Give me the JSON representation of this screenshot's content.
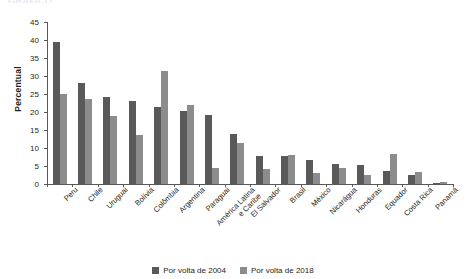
{
  "title_remnant": "GRÁFICO",
  "legend": {
    "position": "bottom",
    "items": [
      {
        "label": "Por volta de 2004",
        "color": "#595959"
      },
      {
        "label": "Por volta de 2018",
        "color": "#8c8c8c"
      }
    ]
  },
  "chart_data": {
    "type": "bar",
    "title": "",
    "xlabel": "",
    "ylabel": "Percentual",
    "ylim": [
      0,
      45
    ],
    "yticks": [
      0,
      5,
      10,
      15,
      20,
      25,
      30,
      35,
      40,
      45
    ],
    "grid": false,
    "legend_position": "bottom",
    "categories": [
      "Peru",
      "Chile",
      "Uruguai",
      "Bolívia",
      "Colômbia",
      "Argentina",
      "Paraguai",
      "América Latina\ne Caribe",
      "El Salvador",
      "Brasil",
      "México",
      "Nicarágua",
      "Honduras",
      "Equador",
      "Costa Rica",
      "Panamá"
    ],
    "series": [
      {
        "name": "Por volta de 2004",
        "color": "#595959",
        "values": [
          39.5,
          28.0,
          24.3,
          23.0,
          21.5,
          20.2,
          19.3,
          14.0,
          7.8,
          7.7,
          6.6,
          5.5,
          5.2,
          3.7,
          2.6,
          0.4
        ]
      },
      {
        "name": "Por volta de 2018",
        "color": "#8c8c8c",
        "values": [
          25.0,
          23.5,
          19.0,
          13.5,
          31.3,
          22.0,
          4.4,
          11.5,
          4.1,
          8.1,
          3.0,
          4.5,
          2.5,
          8.2,
          3.2,
          0.5
        ]
      }
    ]
  }
}
